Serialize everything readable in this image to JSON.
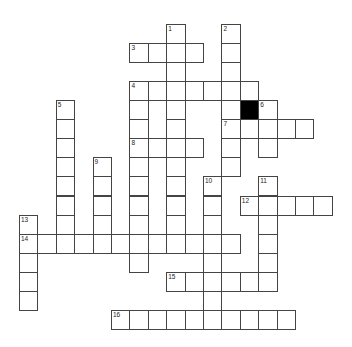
{
  "puzzle": {
    "type": "crossword",
    "grid": {
      "origin_x": 19,
      "origin_y": 24,
      "cell_w": 18.4,
      "cell_h": 19.05,
      "cols": 17,
      "rows": 16
    },
    "black_cells": [
      [
        12,
        4
      ]
    ],
    "entries": [
      {
        "number": "1",
        "direction": "down",
        "col": 8,
        "row": 0,
        "length": 12
      },
      {
        "number": "2",
        "direction": "down",
        "col": 11,
        "row": 0,
        "length": 8
      },
      {
        "number": "3",
        "direction": "across",
        "col": 6,
        "row": 1,
        "length": 4
      },
      {
        "number": "4",
        "direction": "across",
        "col": 6,
        "row": 3,
        "length": 7
      },
      {
        "number": "4",
        "direction": "down",
        "col": 6,
        "row": 3,
        "length": 10
      },
      {
        "number": "5",
        "direction": "down",
        "col": 2,
        "row": 4,
        "length": 8
      },
      {
        "number": "6",
        "direction": "down",
        "col": 13,
        "row": 4,
        "length": 3
      },
      {
        "number": "7",
        "direction": "across",
        "col": 11,
        "row": 5,
        "length": 5
      },
      {
        "number": "8",
        "direction": "across",
        "col": 6,
        "row": 6,
        "length": 4
      },
      {
        "number": "9",
        "direction": "down",
        "col": 4,
        "row": 7,
        "length": 5
      },
      {
        "number": "10",
        "direction": "down",
        "col": 10,
        "row": 8,
        "length": 8
      },
      {
        "number": "11",
        "direction": "down",
        "col": 13,
        "row": 8,
        "length": 6
      },
      {
        "number": "12",
        "direction": "across",
        "col": 12,
        "row": 9,
        "length": 5
      },
      {
        "number": "13",
        "direction": "down",
        "col": 0,
        "row": 10,
        "length": 5
      },
      {
        "number": "14",
        "direction": "across",
        "col": 0,
        "row": 11,
        "length": 12
      },
      {
        "number": "15",
        "direction": "across",
        "col": 8,
        "row": 13,
        "length": 6
      },
      {
        "number": "16",
        "direction": "across",
        "col": 5,
        "row": 15,
        "length": 10
      }
    ]
  }
}
